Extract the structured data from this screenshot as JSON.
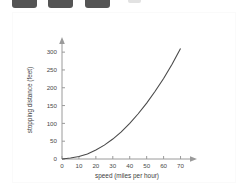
{
  "thumbnails": {
    "name": "cropped-thumbnail-strip",
    "items": [
      {
        "label": "thumbnail-1"
      },
      {
        "label": "thumbnail-2"
      },
      {
        "label": "thumbnail-3"
      }
    ],
    "faint_item_label": "thumbnail-4",
    "color": "#545454"
  },
  "chart_data": {
    "type": "line",
    "title": "",
    "xlabel": "speed (miles per hour)",
    "ylabel": "stopping distance (feet)",
    "xlim": [
      0,
      75
    ],
    "ylim": [
      0,
      320
    ],
    "xticks": [
      0,
      10,
      20,
      30,
      40,
      50,
      60,
      70
    ],
    "xtick_labels": [
      "0",
      "10",
      "20",
      "30",
      "40",
      "50",
      "60",
      "70"
    ],
    "yticks": [
      0,
      50,
      100,
      150,
      200,
      250,
      300
    ],
    "ytick_labels": [
      "0",
      "50",
      "100",
      "150",
      "200",
      "250",
      "300"
    ],
    "grid": false,
    "legend": null,
    "series": [
      {
        "name": "stopping distance",
        "color": "#4a4a4a",
        "x": [
          0,
          5,
          10,
          15,
          20,
          25,
          30,
          35,
          40,
          45,
          50,
          55,
          60,
          65,
          70
        ],
        "y": [
          0,
          3,
          7,
          14,
          25,
          39,
          56,
          76,
          100,
          127,
          157,
          190,
          226,
          266,
          310
        ]
      }
    ]
  }
}
